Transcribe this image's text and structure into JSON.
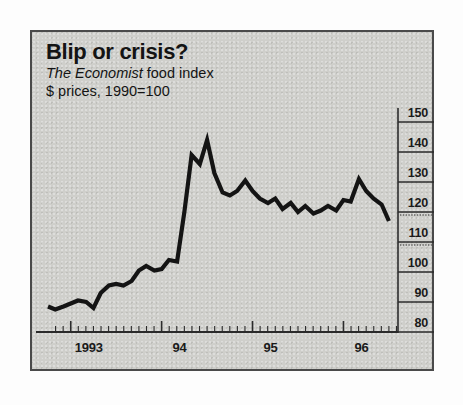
{
  "figure": {
    "title": "Blip or crisis?",
    "subtitle_publication": "The Economist",
    "subtitle_rest": " food index",
    "subtitle_line2": "$ prices, 1990=100",
    "background_color": "#cfcfcb",
    "border_color": "#4a4a4a",
    "line_color": "#141414"
  },
  "chart_data": {
    "type": "line",
    "title": "Blip or crisis?",
    "subtitle": "The Economist food index",
    "units": "$ prices, 1990=100",
    "xlabel": "",
    "ylabel": "",
    "ylim": [
      80,
      150
    ],
    "y_ticks": [
      80,
      90,
      100,
      110,
      120,
      130,
      140,
      150
    ],
    "y_tick_labels": [
      "80",
      "90",
      "100",
      "110",
      "120",
      "130",
      "140",
      "150"
    ],
    "y_axis_position": "right",
    "x_ticks": [
      1993.0,
      1994.0,
      1995.0,
      1996.0
    ],
    "x_tick_labels": [
      "1993",
      "94",
      "95",
      "96"
    ],
    "x_minor_tick_interval_months": 1,
    "xlim": [
      1992.75,
      1996.6
    ],
    "grid": false,
    "legend": false,
    "series": [
      {
        "name": "The Economist food index",
        "x": [
          1992.75,
          1992.83,
          1992.92,
          1993.0,
          1993.08,
          1993.17,
          1993.25,
          1993.33,
          1993.42,
          1993.5,
          1993.58,
          1993.67,
          1993.75,
          1993.83,
          1993.92,
          1994.0,
          1994.08,
          1994.17,
          1994.25,
          1994.33,
          1994.42,
          1994.5,
          1994.58,
          1994.67,
          1994.75,
          1994.83,
          1994.92,
          1995.0,
          1995.08,
          1995.17,
          1995.25,
          1995.33,
          1995.42,
          1995.5,
          1995.58,
          1995.67,
          1995.75,
          1995.83,
          1995.92,
          1996.0,
          1996.08,
          1996.17,
          1996.25,
          1996.33,
          1996.42,
          1996.5
        ],
        "y": [
          88.5,
          87.5,
          88.5,
          89.5,
          90.5,
          90.0,
          88.0,
          93.0,
          95.5,
          96.0,
          95.5,
          97.0,
          100.5,
          102.0,
          100.5,
          101.0,
          104.0,
          103.5,
          120.0,
          139.0,
          136.0,
          144.0,
          133.0,
          126.5,
          125.5,
          127.0,
          130.5,
          127.0,
          124.5,
          123.0,
          124.5,
          121.0,
          123.0,
          120.0,
          122.0,
          119.5,
          120.5,
          122.0,
          120.5,
          124.0,
          123.5,
          131.0,
          127.0,
          124.5,
          122.5,
          117.0
        ]
      }
    ]
  }
}
